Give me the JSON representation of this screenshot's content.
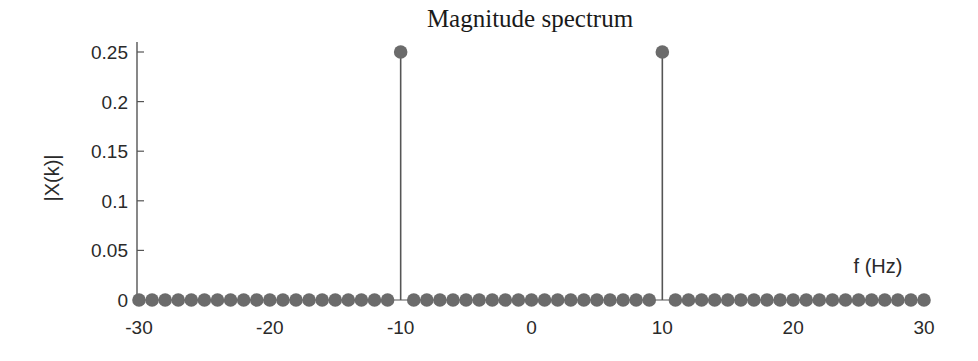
{
  "chart_data": {
    "type": "stem",
    "title": "Magnitude spectrum",
    "xlabel": "f (Hz)",
    "ylabel": "|X(k)|",
    "xlim": [
      -30,
      30
    ],
    "ylim": [
      0,
      0.25
    ],
    "xticks": [
      -30,
      -20,
      -10,
      0,
      10,
      20,
      30
    ],
    "xtick_labels": [
      "-30",
      "-20",
      "-10",
      "0",
      "10",
      "20",
      "30"
    ],
    "yticks": [
      0,
      0.05,
      0.1,
      0.15,
      0.2,
      0.25
    ],
    "ytick_labels": [
      "0",
      "0.05",
      "0.1",
      "0.15",
      "0.2",
      "0.25"
    ],
    "grid": false,
    "legend": null,
    "series": [
      {
        "name": "|X(k)|",
        "x": [
          -30,
          -29,
          -28,
          -27,
          -26,
          -25,
          -24,
          -23,
          -22,
          -21,
          -20,
          -19,
          -18,
          -17,
          -16,
          -15,
          -14,
          -13,
          -12,
          -11,
          -10,
          -9,
          -8,
          -7,
          -6,
          -5,
          -4,
          -3,
          -2,
          -1,
          0,
          1,
          2,
          3,
          4,
          5,
          6,
          7,
          8,
          9,
          10,
          11,
          12,
          13,
          14,
          15,
          16,
          17,
          18,
          19,
          20,
          21,
          22,
          23,
          24,
          25,
          26,
          27,
          28,
          29,
          30
        ],
        "values": [
          0,
          0,
          0,
          0,
          0,
          0,
          0,
          0,
          0,
          0,
          0,
          0,
          0,
          0,
          0,
          0,
          0,
          0,
          0,
          0,
          0.25,
          0,
          0,
          0,
          0,
          0,
          0,
          0,
          0,
          0,
          0,
          0,
          0,
          0,
          0,
          0,
          0,
          0,
          0,
          0,
          0.25,
          0,
          0,
          0,
          0,
          0,
          0,
          0,
          0,
          0,
          0,
          0,
          0,
          0,
          0,
          0,
          0,
          0,
          0,
          0,
          0
        ]
      }
    ]
  },
  "colors": {
    "marker": "#6b6b6b",
    "stem": "#555555",
    "axis": "#555555",
    "text": "#2a2a2a",
    "background": "#ffffff"
  }
}
